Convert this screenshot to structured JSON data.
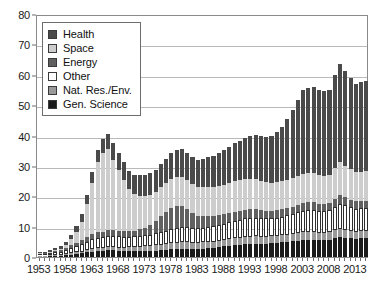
{
  "chart_data": {
    "type": "bar",
    "stacked": true,
    "title": "",
    "subtitle": "",
    "xlabel": "",
    "ylabel": "",
    "ylim": [
      0,
      80
    ],
    "yticks": [
      0,
      10,
      20,
      30,
      40,
      50,
      60,
      70,
      80
    ],
    "grid": true,
    "legend_position": "upper-left",
    "x_tick_labels": [
      "1953",
      "1958",
      "1963",
      "1968",
      "1973",
      "1978",
      "1983",
      "1988",
      "1993",
      "1998",
      "2003",
      "2008",
      "2013"
    ],
    "x_tick_step_years": 5,
    "categories": [
      "1953",
      "1954",
      "1955",
      "1956",
      "1957",
      "1958",
      "1959",
      "1960",
      "1961",
      "1962",
      "1963",
      "1964",
      "1965",
      "1966",
      "1967",
      "1968",
      "1969",
      "1970",
      "1971",
      "1972",
      "1973",
      "1974",
      "1975",
      "1976",
      "1977",
      "1978",
      "1979",
      "1980",
      "1981",
      "1982",
      "1983",
      "1984",
      "1985",
      "1986",
      "1987",
      "1988",
      "1989",
      "1990",
      "1991",
      "1992",
      "1993",
      "1994",
      "1995",
      "1996",
      "1997",
      "1998",
      "1999",
      "2000",
      "2001",
      "2002",
      "2003",
      "2004",
      "2005",
      "2006",
      "2007",
      "2008",
      "2009",
      "2010",
      "2011",
      "2012",
      "2013",
      "2014",
      "2015"
    ],
    "series": [
      {
        "name": "Gen. Science",
        "color": "#1b1b1b",
        "values": [
          0.3,
          0.3,
          0.4,
          0.4,
          0.5,
          0.6,
          0.8,
          1.0,
          1.2,
          1.5,
          1.8,
          2.0,
          2.1,
          2.2,
          2.2,
          2.1,
          2.0,
          2.0,
          2.0,
          2.0,
          2.0,
          2.0,
          2.1,
          2.2,
          2.3,
          2.5,
          2.6,
          2.6,
          2.6,
          2.6,
          2.7,
          2.8,
          3.0,
          3.1,
          3.3,
          3.5,
          3.6,
          3.8,
          4.0,
          4.2,
          4.3,
          4.4,
          4.4,
          4.4,
          4.5,
          4.6,
          4.8,
          5.0,
          5.2,
          5.4,
          5.6,
          5.7,
          5.7,
          5.6,
          5.6,
          5.7,
          6.2,
          6.6,
          6.4,
          6.2,
          6.0,
          6.1,
          6.2
        ]
      },
      {
        "name": "Nat. Res./Env.",
        "color": "#9a9a9a",
        "values": [
          0.2,
          0.2,
          0.2,
          0.3,
          0.3,
          0.4,
          0.4,
          0.5,
          0.6,
          0.7,
          0.8,
          0.9,
          0.9,
          1.0,
          1.0,
          1.0,
          1.1,
          1.2,
          1.3,
          1.4,
          1.5,
          1.6,
          1.7,
          1.8,
          1.9,
          2.0,
          2.1,
          2.2,
          2.2,
          2.1,
          2.0,
          2.0,
          2.0,
          2.0,
          2.1,
          2.1,
          2.2,
          2.3,
          2.3,
          2.4,
          2.4,
          2.4,
          2.3,
          2.3,
          2.3,
          2.3,
          2.3,
          2.4,
          2.4,
          2.5,
          2.5,
          2.5,
          2.5,
          2.4,
          2.4,
          2.4,
          2.6,
          2.7,
          2.6,
          2.5,
          2.4,
          2.4,
          2.4
        ]
      },
      {
        "name": "Other",
        "color": "#ffffff",
        "values": [
          0.4,
          0.5,
          0.6,
          0.8,
          1.0,
          1.3,
          1.7,
          2.0,
          2.4,
          2.8,
          3.2,
          3.5,
          3.6,
          3.8,
          3.8,
          3.7,
          3.6,
          3.5,
          3.5,
          3.6,
          3.7,
          3.8,
          4.0,
          4.2,
          4.4,
          4.7,
          4.9,
          5.1,
          5.0,
          4.8,
          4.7,
          4.8,
          4.9,
          5.0,
          5.2,
          5.4,
          5.6,
          5.8,
          6.0,
          6.1,
          6.2,
          6.2,
          6.1,
          6.0,
          6.0,
          6.1,
          6.2,
          6.4,
          6.6,
          6.9,
          7.2,
          7.4,
          7.4,
          7.3,
          7.2,
          7.3,
          7.8,
          8.2,
          8.0,
          7.7,
          7.5,
          7.5,
          7.6
        ]
      },
      {
        "name": "Energy",
        "color": "#606060",
        "values": [
          0.3,
          0.4,
          0.4,
          0.5,
          0.6,
          0.7,
          0.9,
          1.1,
          1.3,
          1.5,
          1.7,
          1.8,
          1.8,
          1.9,
          1.9,
          1.8,
          1.8,
          1.8,
          1.9,
          2.1,
          2.4,
          3.0,
          4.0,
          5.2,
          6.3,
          7.0,
          7.2,
          6.8,
          6.0,
          5.0,
          4.2,
          3.8,
          3.6,
          3.4,
          3.3,
          3.2,
          3.1,
          3.0,
          3.0,
          2.9,
          2.9,
          2.8,
          2.7,
          2.6,
          2.5,
          2.5,
          2.4,
          2.4,
          2.4,
          2.4,
          2.5,
          2.5,
          2.4,
          2.3,
          2.3,
          2.3,
          2.6,
          2.9,
          2.7,
          2.5,
          2.4,
          2.4,
          2.4
        ]
      },
      {
        "name": "Space",
        "color": "#cdcdcd",
        "values": [
          0.1,
          0.1,
          0.2,
          0.3,
          0.4,
          0.8,
          2.0,
          3.5,
          6.0,
          11.0,
          17.0,
          23.0,
          26.0,
          26.5,
          23.0,
          20.0,
          17.0,
          14.0,
          12.0,
          11.0,
          10.5,
          10.0,
          9.5,
          9.5,
          9.5,
          9.5,
          9.5,
          9.5,
          9.5,
          9.5,
          9.5,
          9.5,
          9.5,
          9.5,
          9.5,
          9.5,
          9.8,
          10.0,
          10.0,
          10.0,
          10.0,
          9.8,
          9.6,
          9.3,
          9.2,
          9.2,
          9.2,
          9.3,
          9.4,
          9.5,
          9.6,
          9.7,
          9.6,
          9.4,
          9.3,
          9.4,
          10.2,
          10.8,
          10.4,
          10.0,
          9.6,
          9.6,
          9.6
        ]
      },
      {
        "name": "Health",
        "color": "#4a4a4a",
        "values": [
          0.2,
          0.3,
          0.4,
          0.6,
          0.9,
          1.2,
          1.6,
          2.0,
          2.5,
          3.0,
          3.5,
          4.0,
          4.5,
          5.0,
          5.5,
          5.8,
          5.8,
          5.8,
          6.2,
          6.8,
          7.0,
          7.2,
          7.3,
          7.6,
          8.0,
          8.6,
          9.0,
          9.2,
          9.0,
          8.8,
          9.0,
          9.5,
          10.0,
          10.2,
          11.0,
          11.5,
          12.0,
          12.5,
          13.0,
          13.5,
          14.0,
          14.5,
          14.7,
          14.8,
          15.5,
          16.5,
          18.0,
          20.0,
          22.5,
          25.0,
          27.5,
          28.0,
          28.3,
          28.0,
          27.8,
          28.0,
          30.5,
          32.5,
          31.0,
          30.0,
          29.0,
          29.5,
          29.8
        ]
      }
    ]
  },
  "legend": {
    "items": [
      {
        "label": "Health",
        "color": "#4a4a4a"
      },
      {
        "label": "Space",
        "color": "#cdcdcd"
      },
      {
        "label": "Energy",
        "color": "#606060"
      },
      {
        "label": "Other",
        "color": "#ffffff"
      },
      {
        "label": "Nat. Res./Env.",
        "color": "#9a9a9a"
      },
      {
        "label": "Gen. Science",
        "color": "#1b1b1b"
      }
    ]
  },
  "colors": {
    "axis": "#8a8a8a",
    "grid": "#b9b9b9",
    "text": "#1a1a1a",
    "background": "#ffffff",
    "bar_outline": "#2e2e2e"
  }
}
